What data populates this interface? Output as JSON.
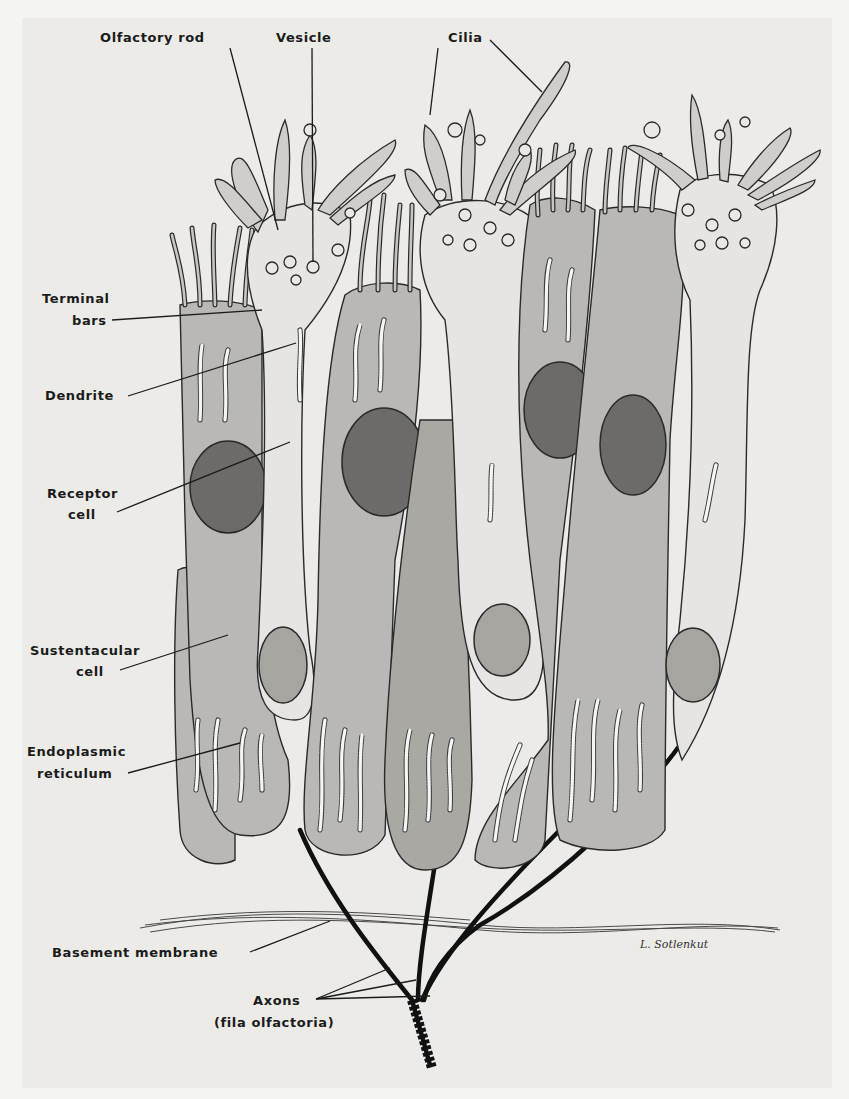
{
  "figure": {
    "signature": "L. Sotlenkut"
  },
  "labels": {
    "olfactory_rod": "Olfactory rod",
    "vesicle": "Vesicle",
    "cilia": "Cilia",
    "terminal_bars_1": "Terminal",
    "terminal_bars_2": "bars",
    "dendrite": "Dendrite",
    "receptor_cell_1": "Receptor",
    "receptor_cell_2": "cell",
    "sustentacular_cell_1": "Sustentacular",
    "sustentacular_cell_2": "cell",
    "endoplasmic_reticulum_1": "Endoplasmic",
    "endoplasmic_reticulum_2": "reticulum",
    "basement_membrane": "Basement membrane",
    "axons_1": "Axons",
    "axons_2": "(fila olfactoria)"
  },
  "colors": {
    "paper": "#ecebe8",
    "sustentacular_cytoplasm": "#b9b8b4",
    "receptor_cytoplasm": "#e6e5e2",
    "nucleus": "#6c6b67",
    "ink": "#1b1b1b"
  }
}
